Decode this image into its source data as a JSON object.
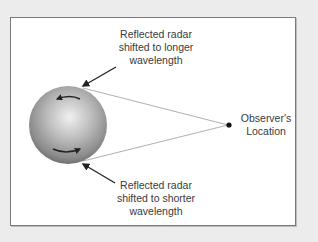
{
  "diagram": {
    "labels": {
      "top": [
        "Reflected radar",
        "shifted to longer",
        "wavelength"
      ],
      "bottom": [
        "Reflected radar",
        "shifted to shorter",
        "wavelength"
      ],
      "observer": [
        "Observer's",
        "Location"
      ]
    },
    "colors": {
      "background": "#ececec",
      "panel": "#ffffff",
      "border": "#7a7a7a",
      "text": "#3a3a3a",
      "sightline": "#9a9a9a",
      "arrow": "#222222",
      "sphere_light": "#e6e6e6",
      "sphere_dark": "#6b6b6b"
    },
    "elements": {
      "planet": "sphere",
      "rotation_arrows": [
        "left-pointing arrow near top",
        "right-pointing arrow near bottom"
      ],
      "observer_point": "dot"
    }
  }
}
